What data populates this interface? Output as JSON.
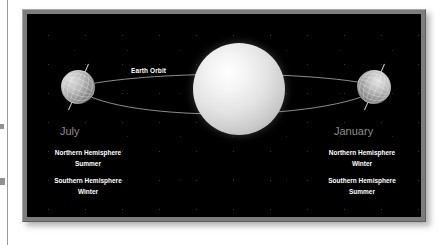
{
  "figure": {
    "orbit_label": "Earth Orbit",
    "background_color": "#000000",
    "frame_color": "#7d7d7d",
    "month_label_color": "#8d8d8d",
    "text_color": "#ffffff"
  },
  "sun": {
    "name": "sun"
  },
  "positions": [
    {
      "id": "july",
      "month": "July",
      "northern": {
        "hemisphere": "Northern Hemisphere",
        "season": "Summer"
      },
      "southern": {
        "hemisphere": "Southern Hemisphere",
        "season": "Winter"
      }
    },
    {
      "id": "january",
      "month": "January",
      "northern": {
        "hemisphere": "Northern Hemisphere",
        "season": "Winter"
      },
      "southern": {
        "hemisphere": "Southern Hemisphere",
        "season": "Summer"
      }
    }
  ]
}
